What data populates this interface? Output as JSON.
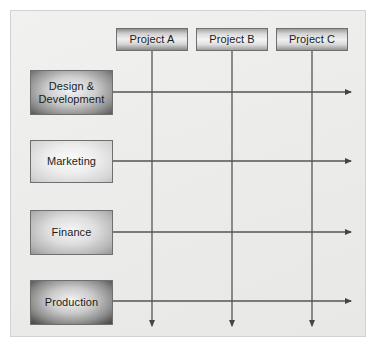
{
  "diagram": {
    "type": "matrix-organisation",
    "colors": {
      "panel_background": "#ececeb",
      "panel_border": "#d2d2d1",
      "line": "#555555",
      "box_border": "#6f6f6f",
      "text": "#1b1b1b"
    },
    "projects": [
      {
        "label": "Project A",
        "x": 116,
        "y": 28,
        "w": 72,
        "h": 23,
        "line_x": 152,
        "arrow_y": 327
      },
      {
        "label": "Project B",
        "x": 196,
        "y": 28,
        "w": 72,
        "h": 23,
        "line_x": 232,
        "arrow_y": 327
      },
      {
        "label": "Project C",
        "x": 276,
        "y": 28,
        "w": 72,
        "h": 23,
        "line_x": 312,
        "arrow_y": 327
      }
    ],
    "departments": [
      {
        "label": "Design &\nDevelopment",
        "x": 30,
        "y": 70,
        "w": 83,
        "h": 45,
        "line_y": 92,
        "arrow_x": 352
      },
      {
        "label": "Marketing",
        "x": 30,
        "y": 140,
        "w": 83,
        "h": 43,
        "line_y": 161,
        "arrow_x": 352
      },
      {
        "label": "Finance",
        "x": 30,
        "y": 210,
        "w": 83,
        "h": 45,
        "line_y": 232,
        "arrow_x": 352
      },
      {
        "label": "Production",
        "x": 30,
        "y": 280,
        "w": 83,
        "h": 45,
        "line_y": 301,
        "arrow_x": 352
      }
    ]
  }
}
